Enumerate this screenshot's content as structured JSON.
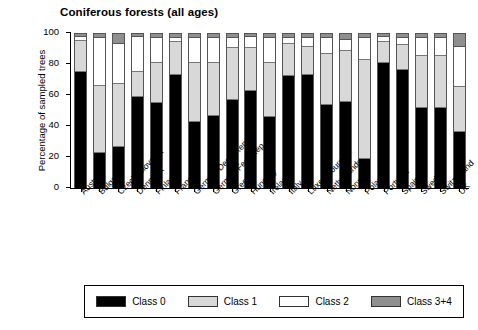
{
  "chart_data": {
    "type": "bar",
    "subtype": "stacked-percentage",
    "title": "Coniferous forests (all ages)",
    "xlabel": "",
    "ylabel": "Percentage of sampled trees",
    "ylim": [
      0,
      100
    ],
    "yticks": [
      0,
      20,
      40,
      60,
      80,
      100
    ],
    "grid": false,
    "legend_position": "bottom",
    "categories": [
      "Austria",
      "Bulgaria",
      "Czechoslovakia",
      "Denmark",
      "Finland",
      "France",
      "German Dem. Rep.",
      "German Fed. Rep.",
      "Greece",
      "Hungary",
      "Ireland",
      "Italy",
      "Luxembourg",
      "Netherlands",
      "Norway",
      "Poland",
      "Portugal",
      "Spain",
      "Sweden",
      "Switzerland",
      "UK"
    ],
    "series": [
      {
        "name": "Class 0",
        "color": "#000000",
        "values": [
          77,
          23,
          27,
          60,
          56,
          75,
          44,
          48,
          58,
          64,
          47,
          74,
          75,
          55,
          57,
          19,
          83,
          78,
          53,
          53,
          37
        ]
      },
      {
        "name": "Class 1",
        "color": "#d8d8d8",
        "values": [
          20,
          44,
          41,
          16,
          26,
          21,
          38,
          34,
          34,
          28,
          35,
          21,
          18,
          33,
          33,
          65,
          13,
          16,
          34,
          34,
          29
        ]
      },
      {
        "name": "Class 2",
        "color": "#ffffff",
        "values": [
          2,
          31,
          26,
          23,
          16,
          2,
          16,
          16,
          6,
          7,
          16,
          3,
          5,
          10,
          7,
          14,
          3,
          4,
          11,
          11,
          26
        ]
      },
      {
        "name": "Class 3+4",
        "color": "#8f8f8f",
        "values": [
          1,
          2,
          6,
          1,
          2,
          2,
          2,
          2,
          2,
          1,
          2,
          2,
          2,
          2,
          3,
          2,
          1,
          2,
          2,
          2,
          8
        ]
      }
    ]
  },
  "legend": {
    "items": [
      {
        "label": "Class 0",
        "key": "c0"
      },
      {
        "label": "Class 1",
        "key": "c1"
      },
      {
        "label": "Class 2",
        "key": "c2"
      },
      {
        "label": "Class 3+4",
        "key": "c3"
      }
    ]
  }
}
